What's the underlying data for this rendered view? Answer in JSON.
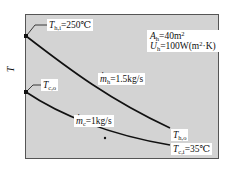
{
  "diagram": {
    "type": "temperature profile (counter-flow heat exchanger)",
    "y_axis_label": "T",
    "frame_color": "#d3d3d3",
    "line_color": "#111111",
    "curves": [
      {
        "name": "hot-fluid",
        "start_label": "T_h,i",
        "end_label": "T_h,o"
      },
      {
        "name": "cold-fluid",
        "start_label": "T_c,o",
        "end_label": "T_c,i"
      }
    ]
  },
  "labels": {
    "th_in": {
      "sym": "T",
      "sub": "h,i",
      "value": "=250℃"
    },
    "th_out": {
      "sym": "T",
      "sub": "h,o"
    },
    "tc_out": {
      "sym": "T",
      "sub": "c,o"
    },
    "tc_in": {
      "sym": "T",
      "sub": "c,i",
      "value": "=35℃"
    },
    "mh": {
      "sym": "m",
      "sub": "h",
      "value": "=1.5kg/s"
    },
    "mc": {
      "sym": "m",
      "sub": "c",
      "value": "=1kg/s"
    },
    "area": {
      "sym": "A",
      "sub": "h",
      "value": "=40m",
      "sup": "2"
    },
    "u": {
      "sym": "U",
      "sub": "h",
      "value": "=100W(m",
      "sup": "2",
      "tail": "·K)"
    }
  }
}
